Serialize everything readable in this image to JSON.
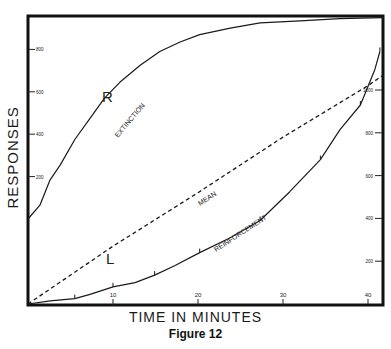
{
  "figure": {
    "caption": "Figure 12",
    "xlabel": "TIME IN MINUTES",
    "ylabel": "RESPONSES"
  },
  "labels": {
    "R": "R",
    "L": "L",
    "extinction": "EXTINCTION",
    "mean": "MEAN",
    "reinforcement": "REINFORCEMENT"
  },
  "chart_data": {
    "type": "line",
    "title": "Figure 12",
    "xlabel": "TIME IN MINUTES",
    "ylabel": "RESPONSES",
    "xlim": [
      0,
      42
    ],
    "x_ticks": [
      10,
      20,
      30,
      40
    ],
    "left_axis": {
      "applies_to": "Extinction (R)",
      "ticks": [
        200,
        400,
        600,
        800
      ],
      "ylim": [
        0,
        950
      ]
    },
    "right_axis": {
      "applies_to": "Reinforcement (L) and Mean",
      "ticks": [
        200,
        400,
        600,
        800,
        1000
      ],
      "ylim": [
        0,
        1400
      ]
    },
    "grid": false,
    "legend": "inline curve labels",
    "series": [
      {
        "name": "Extinction",
        "curve_label": "R",
        "axis": "left",
        "style": "solid",
        "x": [
          0,
          1.4,
          2.6,
          3.8,
          5.5,
          7.3,
          9,
          10.8,
          13.2,
          15.5,
          17.9,
          20.2,
          23.8,
          27.3,
          32,
          36.7,
          41.8
        ],
        "y": [
          0,
          65,
          185,
          255,
          375,
          475,
          570,
          645,
          725,
          790,
          835,
          870,
          900,
          925,
          935,
          945,
          950
        ]
      },
      {
        "name": "Mean",
        "axis": "right",
        "style": "dashed",
        "x": [
          0,
          10,
          20,
          30,
          40,
          41.8
        ],
        "y": [
          0,
          270,
          520,
          780,
          1020,
          1070
        ]
      },
      {
        "name": "Reinforcement",
        "curve_label": "L",
        "axis": "right",
        "style": "solid",
        "x": [
          0,
          2.6,
          5.5,
          7.3,
          10,
          12.6,
          14.9,
          17.3,
          20.2,
          23.8,
          27.3,
          30.8,
          34.4,
          36.7,
          39.1,
          40.8,
          41.4
        ],
        "y": [
          0,
          15,
          25,
          45,
          80,
          100,
          135,
          180,
          240,
          310,
          390,
          525,
          675,
          815,
          930,
          1095,
          1180
        ]
      }
    ]
  }
}
